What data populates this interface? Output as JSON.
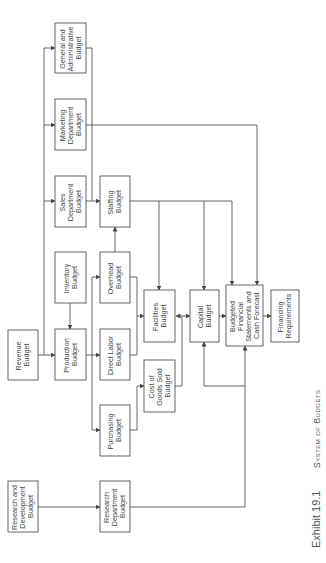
{
  "caption": {
    "exhibit": "Exhibit 19.1",
    "title": "System of Budgets"
  },
  "boxes": {
    "general_admin": {
      "lines": [
        "General and",
        "Administrative",
        "Budget"
      ]
    },
    "marketing": {
      "lines": [
        "Marketing",
        "Department",
        "Budget"
      ]
    },
    "sales": {
      "lines": [
        "Sales",
        "Department",
        "Budget"
      ]
    },
    "staffing": {
      "lines": [
        "Staffing",
        "Budget"
      ]
    },
    "inventory": {
      "lines": [
        "Inventory",
        "Budget"
      ]
    },
    "overhead": {
      "lines": [
        "Overhead",
        "Budget"
      ]
    },
    "revenue": {
      "lines": [
        "Revenue",
        "Budget"
      ]
    },
    "production": {
      "lines": [
        "Production",
        "Budget"
      ]
    },
    "direct_labor": {
      "lines": [
        "Direct Labor",
        "Budget"
      ]
    },
    "facilities": {
      "lines": [
        "Facilities",
        "Budget"
      ]
    },
    "capital": {
      "lines": [
        "Capital",
        "Budget"
      ]
    },
    "budgeted_fs": {
      "lines": [
        "Budgeted",
        "Financial",
        "Statements and",
        "Cash Forecast"
      ]
    },
    "financing": {
      "lines": [
        "Financing",
        "Requirements"
      ]
    },
    "cogs": {
      "lines": [
        "Cost of",
        "Goods Sold",
        "Budget"
      ]
    },
    "purchasing": {
      "lines": [
        "Purchasing",
        "Budget"
      ]
    },
    "rnd": {
      "lines": [
        "Research and",
        "Development",
        "Budget"
      ]
    },
    "research_dept": {
      "lines": [
        "Research",
        "Department",
        "Budget"
      ]
    }
  },
  "colors": {
    "line": "#555555",
    "text": "#444444",
    "background": "#ffffff"
  }
}
